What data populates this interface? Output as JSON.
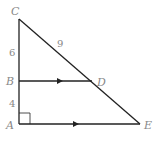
{
  "diagram": {
    "type": "geometry-triangle",
    "points": {
      "A": {
        "label": "A",
        "x": 19,
        "y": 124
      },
      "B": {
        "label": "B",
        "x": 19,
        "y": 81
      },
      "C": {
        "label": "C",
        "x": 19,
        "y": 19
      },
      "D": {
        "label": "D",
        "x": 92,
        "y": 81
      },
      "E": {
        "label": "E",
        "x": 140,
        "y": 124
      }
    },
    "segment_labels": {
      "CB": "6",
      "BA": "4",
      "CD": "9"
    },
    "parallel_marks": [
      "BD",
      "AE"
    ],
    "right_angle_at": "A"
  }
}
